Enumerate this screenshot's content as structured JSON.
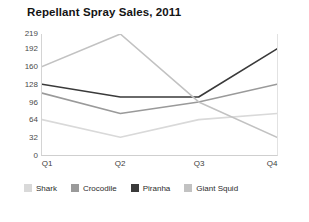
{
  "chart_data": {
    "type": "line",
    "title": "Repellant Spray Sales, 2011",
    "xlabel": "",
    "ylabel": "",
    "categories": [
      "Q1",
      "Q2",
      "Q3",
      "Q4"
    ],
    "yticks": [
      0,
      32,
      64,
      96,
      128,
      160,
      192,
      219
    ],
    "ylim": [
      0,
      219
    ],
    "grid": false,
    "legend_position": "bottom",
    "series": [
      {
        "name": "Shark",
        "color": "#d9d9d9",
        "values": [
          64,
          32,
          64,
          75
        ]
      },
      {
        "name": "Crocodile",
        "color": "#9a9a9a",
        "values": [
          112,
          75,
          96,
          128
        ]
      },
      {
        "name": "Piranha",
        "color": "#3a3a3a",
        "values": [
          128,
          105,
          105,
          192
        ]
      },
      {
        "name": "Giant Squid",
        "color": "#c2c2c2",
        "values": [
          160,
          219,
          96,
          32
        ]
      }
    ]
  },
  "legend": {
    "items": [
      {
        "label": "Shark"
      },
      {
        "label": "Crocodile"
      },
      {
        "label": "Piranha"
      },
      {
        "label": "Giant Squid"
      }
    ]
  }
}
